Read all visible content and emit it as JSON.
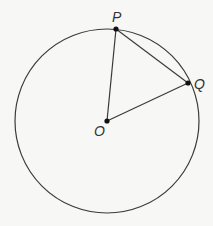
{
  "diagram": {
    "type": "circle-geometry",
    "circle": {
      "center": "O",
      "cx": 107,
      "cy": 121,
      "r": 92
    },
    "points": [
      {
        "id": "P",
        "label": "P",
        "x": 116,
        "y": 29,
        "label_x": 112,
        "label_y": 22
      },
      {
        "id": "Q",
        "label": "Q",
        "x": 188,
        "y": 83,
        "label_x": 194,
        "label_y": 89
      },
      {
        "id": "O",
        "label": "O",
        "x": 107,
        "y": 121,
        "label_x": 94,
        "label_y": 136
      }
    ],
    "segments": [
      {
        "from": "O",
        "to": "P",
        "name": "radius OP"
      },
      {
        "from": "O",
        "to": "Q",
        "name": "radius OQ"
      },
      {
        "from": "P",
        "to": "Q",
        "name": "chord PQ"
      }
    ],
    "colors": {
      "stroke": "#3a3a3a",
      "background": "#f7f7f6"
    }
  }
}
